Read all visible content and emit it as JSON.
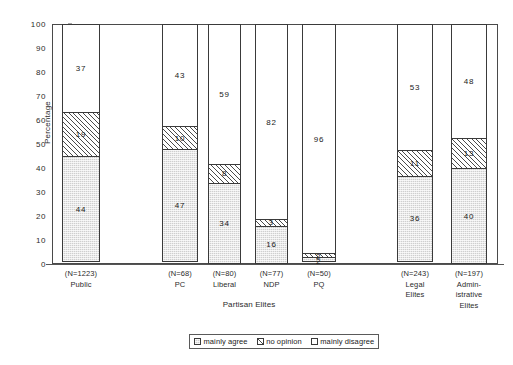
{
  "chart_data": {
    "type": "bar",
    "subtype": "stacked-vertical-100pct",
    "title": "",
    "xlabel": "",
    "ylabel": "Percentage",
    "ylim": [
      0,
      100
    ],
    "yticks": [
      0,
      10,
      20,
      30,
      40,
      50,
      60,
      70,
      80,
      90,
      100
    ],
    "grid": false,
    "legend_position": "bottom-center",
    "categories": [
      "Public",
      "PC",
      "Liberal",
      "NDP",
      "PQ",
      "Legal Elites",
      "Administrative Elites"
    ],
    "category_labels": [
      {
        "n": "(N=1223)",
        "lines": [
          "Public"
        ]
      },
      {
        "n": "(N=68)",
        "lines": [
          "PC"
        ]
      },
      {
        "n": "(N=80)",
        "lines": [
          "Liberal"
        ]
      },
      {
        "n": "(N=77)",
        "lines": [
          "NDP"
        ]
      },
      {
        "n": "(N=50)",
        "lines": [
          "PQ"
        ]
      },
      {
        "n": "(N=243)",
        "lines": [
          "Legal",
          "Elites"
        ]
      },
      {
        "n": "(N=197)",
        "lines": [
          "Admin-",
          "istrative",
          "Elites"
        ]
      }
    ],
    "group_labels": [
      {
        "text": "Partisan Elites",
        "spans": [
          "PC",
          "Liberal",
          "NDP",
          "PQ"
        ]
      }
    ],
    "series": [
      {
        "name": "mainly agree",
        "pattern": "dotted-gray",
        "values": [
          44,
          47,
          34,
          16,
          2,
          36,
          40
        ]
      },
      {
        "name": "no opinion",
        "pattern": "diagonal-hatch",
        "values": [
          19,
          10,
          8,
          3,
          2,
          11,
          13
        ]
      },
      {
        "name": "mainly disagree",
        "pattern": "white",
        "values": [
          37,
          43,
          59,
          82,
          96,
          53,
          48
        ]
      }
    ]
  },
  "legend": {
    "items": [
      {
        "label": "mainly agree"
      },
      {
        "label": "no opinion"
      },
      {
        "label": "mainly disagree"
      }
    ]
  }
}
